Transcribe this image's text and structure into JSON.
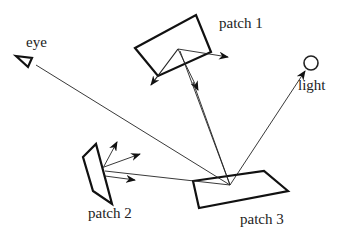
{
  "diagram": {
    "labels": {
      "eye": "eye",
      "light": "light",
      "patch1": "patch 1",
      "patch2": "patch 2",
      "patch3": "patch 3"
    },
    "nodes": [
      {
        "id": "eye",
        "type": "viewer",
        "icon": "eye-triangle-icon"
      },
      {
        "id": "light",
        "type": "light-source",
        "icon": "circle-icon"
      },
      {
        "id": "patch1",
        "type": "surface-patch"
      },
      {
        "id": "patch2",
        "type": "surface-patch"
      },
      {
        "id": "patch3",
        "type": "surface-patch"
      }
    ],
    "edges": [
      {
        "from": "patch3",
        "to": "eye",
        "arrow": false
      },
      {
        "from": "patch3",
        "to": "light",
        "arrow": true
      },
      {
        "from": "patch3",
        "to": "patch1",
        "arrow": false
      },
      {
        "from": "patch3",
        "to": "patch2",
        "arrow": false
      }
    ],
    "colors": {
      "stroke": "#111111",
      "background": "#ffffff"
    }
  }
}
